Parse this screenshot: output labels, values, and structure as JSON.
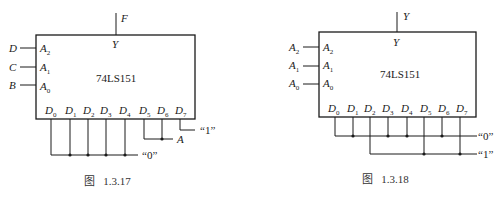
{
  "figures": [
    {
      "caption": "图   1.3.17",
      "chip": "74LS151",
      "output_pin": "Y",
      "output_signal": "F",
      "select_inputs": [
        {
          "signal": "D",
          "pin": "A",
          "pin_sub": "2"
        },
        {
          "signal": "C",
          "pin": "A",
          "pin_sub": "1"
        },
        {
          "signal": "B",
          "pin": "A",
          "pin_sub": "0"
        }
      ],
      "data_pins": [
        "0",
        "1",
        "2",
        "3",
        "4",
        "5",
        "6",
        "7"
      ],
      "data_pin_base": "D",
      "connections": {
        "zero": "“0”",
        "one": "“1”",
        "a": "A"
      },
      "mapping": {
        "D0": "0",
        "D1": "0",
        "D2": "0",
        "D3": "0",
        "D4": "0",
        "D5": "A",
        "D6": "A",
        "D7": "1"
      }
    },
    {
      "caption": "图   1.3.18",
      "chip": "74LS151",
      "output_pin": "Y",
      "output_signal": "Y",
      "select_inputs": [
        {
          "signal": "A",
          "signal_sub": "2",
          "pin": "A",
          "pin_sub": "2"
        },
        {
          "signal": "A",
          "signal_sub": "1",
          "pin": "A",
          "pin_sub": "1"
        },
        {
          "signal": "A",
          "signal_sub": "0",
          "pin": "A",
          "pin_sub": "0"
        }
      ],
      "data_pins": [
        "0",
        "1",
        "2",
        "3",
        "4",
        "5",
        "6",
        "7"
      ],
      "data_pin_base": "D",
      "connections": {
        "zero": "“0”",
        "one": "“1”"
      },
      "mapping": {
        "D0": "0",
        "D1": "0",
        "D2": "1",
        "D3": "0",
        "D4": "0",
        "D5": "1",
        "D6": "0",
        "D7": "1"
      }
    }
  ]
}
